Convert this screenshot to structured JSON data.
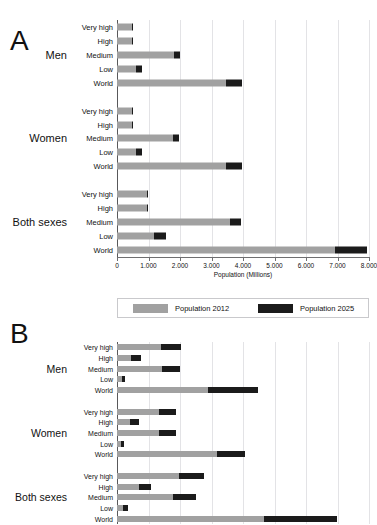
{
  "figure": {
    "axis_title": "Population (Millions)",
    "colors": {
      "series_2012": "#a1a1a1",
      "series_2025": "#1b1b1b",
      "grid": "#e3e3e6",
      "axis": "#58585a"
    },
    "legend": [
      {
        "label": "Population 2012",
        "color": "#a1a1a1"
      },
      {
        "label": "Population 2025",
        "color": "#1b1b1b"
      }
    ],
    "top_artifact": " "
  },
  "panels": [
    {
      "letter": "A"
    },
    {
      "letter": "B"
    }
  ],
  "axis": {
    "ticks": [
      "0",
      "1.000",
      "2.000",
      "3.000",
      "4.000",
      "5.000",
      "6.000",
      "7.000",
      "8.000"
    ],
    "min": 0,
    "max": 8000
  },
  "groups": {
    "men": "Men",
    "women": "Women",
    "both": "Both sexes"
  },
  "categories": [
    "Very high",
    "High",
    "Medium",
    "Low",
    "World"
  ],
  "chart_data": {
    "type": "bar",
    "title": "",
    "subtitle": "",
    "xlabel": "Population (Millions)",
    "ylabel": "",
    "xlim": [
      0,
      8000
    ],
    "grid": true,
    "legend_position": "below-panel-A",
    "orientation": "horizontal",
    "stacked": true,
    "tick_labels": [
      "0",
      "1.000",
      "2.000",
      "3.000",
      "4.000",
      "5.000",
      "6.000",
      "7.000",
      "8.000"
    ],
    "series": [
      {
        "name": "Population 2012",
        "color": "#a1a1a1"
      },
      {
        "name": "Population 2025",
        "color": "#1b1b1b"
      }
    ],
    "panels": [
      {
        "letter": "A",
        "groups": [
          {
            "name": "Men",
            "rows": [
              {
                "category": "Very high",
                "values": [
                  480,
                  30
                ]
              },
              {
                "category": "High",
                "values": [
                  470,
                  25
                ]
              },
              {
                "category": "Medium",
                "values": [
                  1810,
                  180
                ]
              },
              {
                "category": "Low",
                "values": [
                  590,
                  190
                ]
              },
              {
                "category": "World",
                "values": [
                  3460,
                  500
                ]
              }
            ]
          },
          {
            "name": "Women",
            "rows": [
              {
                "category": "Very high",
                "values": [
                  490,
                  25
                ]
              },
              {
                "category": "High",
                "values": [
                  480,
                  25
                ]
              },
              {
                "category": "Medium",
                "values": [
                  1790,
                  170
                ]
              },
              {
                "category": "Low",
                "values": [
                  600,
                  185
                ]
              },
              {
                "category": "World",
                "values": [
                  3460,
                  500
                ]
              }
            ]
          },
          {
            "name": "Both sexes",
            "rows": [
              {
                "category": "Very high",
                "values": [
                  950,
                  40
                ]
              },
              {
                "category": "High",
                "values": [
                  940,
                  40
                ]
              },
              {
                "category": "Medium",
                "values": [
                  3590,
                  350
                ]
              },
              {
                "category": "Low",
                "values": [
                  1180,
                  380
                ]
              },
              {
                "category": "World",
                "values": [
                  6930,
                  1000
                ]
              }
            ]
          }
        ]
      },
      {
        "letter": "B",
        "groups": [
          {
            "name": "Men",
            "rows": [
              {
                "category": "Very high",
                "values": [
                  1400,
                  620
                ]
              },
              {
                "category": "High",
                "values": [
                  460,
                  310
                ]
              },
              {
                "category": "Medium",
                "values": [
                  1430,
                  560
                ]
              },
              {
                "category": "Low",
                "values": [
                  150,
                  90
                ]
              },
              {
                "category": "World",
                "values": [
                  2900,
                  1580
                ]
              }
            ]
          },
          {
            "name": "Women",
            "rows": [
              {
                "category": "Very high",
                "values": [
                  1320,
                  540
                ]
              },
              {
                "category": "High",
                "values": [
                  420,
                  280
                ]
              },
              {
                "category": "Medium",
                "values": [
                  1340,
                  520
                ]
              },
              {
                "category": "Low",
                "values": [
                  140,
                  90
                ]
              },
              {
                "category": "World",
                "values": [
                  3180,
                  880
                ]
              }
            ]
          },
          {
            "name": "Both sexes",
            "rows": [
              {
                "category": "Very high",
                "values": [
                  1960,
                  800
                ]
              },
              {
                "category": "High",
                "values": [
                  700,
                  370
                ]
              },
              {
                "category": "Medium",
                "values": [
                  1790,
                  720
                ]
              },
              {
                "category": "Low",
                "values": [
                  200,
                  150
                ]
              },
              {
                "category": "World",
                "values": [
                  4680,
                  2320
                ]
              }
            ]
          }
        ]
      }
    ]
  }
}
